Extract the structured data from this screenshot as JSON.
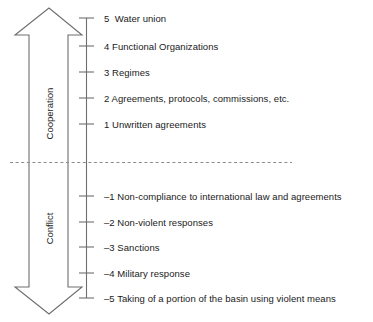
{
  "diagram": {
    "colors": {
      "line": "#6e6e6e",
      "text": "#1a1a1a",
      "background": "#ffffff",
      "divider": "#8c8c8c"
    },
    "axis": {
      "name": "intensity-axis",
      "top_value": 5,
      "bottom_value": -5,
      "tick_values": [
        5,
        4,
        3,
        2,
        1,
        -1,
        -2,
        -3,
        -4,
        -5
      ]
    },
    "divider": {
      "name": "zero-divider",
      "style": "dashed"
    },
    "arrows": [
      {
        "name": "cooperation-arrow",
        "label": "Cooperation",
        "direction": "up"
      },
      {
        "name": "conflict-arrow",
        "label": "Conflict",
        "direction": "down"
      }
    ],
    "levels": [
      {
        "value": "5",
        "number": "5",
        "label": " Water union"
      },
      {
        "value": "4",
        "number": "4",
        "label": "Functional Organizations"
      },
      {
        "value": "3",
        "number": "3",
        "label": "Regimes"
      },
      {
        "value": "2",
        "number": "2",
        "label": "Agreements, protocols, commissions, etc."
      },
      {
        "value": "1",
        "number": "1",
        "label": "Unwritten agreements"
      },
      {
        "value": "-1",
        "number": "–1",
        "label": "Non-compliance to international law and agreements"
      },
      {
        "value": "-2",
        "number": "–2",
        "label": "Non-violent responses"
      },
      {
        "value": "-3",
        "number": "–3",
        "label": "Sanctions"
      },
      {
        "value": "-4",
        "number": "–4",
        "label": "Military response"
      },
      {
        "value": "-5",
        "number": "–5",
        "label": "Taking of a portion of the basin using violent means"
      }
    ],
    "level_text": [
      "5  Water union",
      "4 Functional Organizations",
      "3 Regimes",
      "2 Agreements, protocols, commissions, etc.",
      "1 Unwritten agreements",
      "–1 Non-compliance to international law and agreements",
      "–2 Non-violent responses",
      "–3 Sanctions",
      "–4 Military response",
      "–5 Taking of a portion of the basin using violent means"
    ]
  }
}
